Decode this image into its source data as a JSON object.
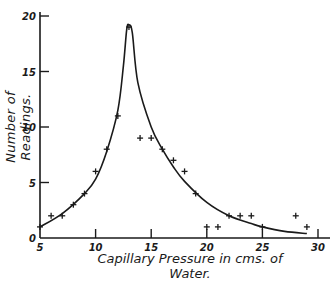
{
  "chart_data": {
    "type": "scatter",
    "title": "",
    "xlabel": "Capillary Pressure in cms. of Water.",
    "ylabel": "Number of Readings.",
    "xlim": [
      5,
      30
    ],
    "ylim": [
      0,
      20
    ],
    "x_ticks": [
      5,
      10,
      15,
      20,
      25,
      30
    ],
    "y_ticks": [
      0,
      5,
      10,
      15,
      20
    ],
    "grid": false,
    "legend": null,
    "series": [
      {
        "name": "Observed readings",
        "marker": "+",
        "points": [
          {
            "x": 5,
            "y": 1
          },
          {
            "x": 6,
            "y": 2
          },
          {
            "x": 7,
            "y": 2
          },
          {
            "x": 8,
            "y": 3
          },
          {
            "x": 9,
            "y": 4
          },
          {
            "x": 10,
            "y": 6
          },
          {
            "x": 11,
            "y": 8
          },
          {
            "x": 12,
            "y": 11
          },
          {
            "x": 13,
            "y": 19
          },
          {
            "x": 14,
            "y": 9
          },
          {
            "x": 15,
            "y": 9
          },
          {
            "x": 16,
            "y": 8
          },
          {
            "x": 17,
            "y": 7
          },
          {
            "x": 18,
            "y": 6
          },
          {
            "x": 19,
            "y": 4
          },
          {
            "x": 20,
            "y": 1
          },
          {
            "x": 21,
            "y": 1
          },
          {
            "x": 22,
            "y": 2
          },
          {
            "x": 23,
            "y": 2
          },
          {
            "x": 24,
            "y": 2
          },
          {
            "x": 25,
            "y": 1
          },
          {
            "x": 28,
            "y": 2
          },
          {
            "x": 29,
            "y": 1
          }
        ]
      },
      {
        "name": "Fitted curve",
        "type": "line",
        "points": [
          {
            "x": 5,
            "y": 1.0
          },
          {
            "x": 7,
            "y": 2.2
          },
          {
            "x": 9,
            "y": 4.0
          },
          {
            "x": 10,
            "y": 5.3
          },
          {
            "x": 11,
            "y": 7.8
          },
          {
            "x": 12,
            "y": 11.5
          },
          {
            "x": 12.5,
            "y": 15.5
          },
          {
            "x": 12.8,
            "y": 18.8
          },
          {
            "x": 13,
            "y": 19.2
          },
          {
            "x": 13.3,
            "y": 18.5
          },
          {
            "x": 13.8,
            "y": 14
          },
          {
            "x": 15,
            "y": 10
          },
          {
            "x": 16,
            "y": 8.0
          },
          {
            "x": 17,
            "y": 6.4
          },
          {
            "x": 18,
            "y": 5.1
          },
          {
            "x": 20,
            "y": 3.2
          },
          {
            "x": 22,
            "y": 2.0
          },
          {
            "x": 24,
            "y": 1.3
          },
          {
            "x": 25,
            "y": 1.0
          },
          {
            "x": 27,
            "y": 0.6
          },
          {
            "x": 29,
            "y": 0.4
          }
        ]
      }
    ]
  },
  "labels": {
    "xlabel": "Capillary Pressure in cms. of Water.",
    "ylabel": "Number of Readings."
  },
  "colors": {
    "ink": "#1a1a1a",
    "background": "#ffffff"
  }
}
